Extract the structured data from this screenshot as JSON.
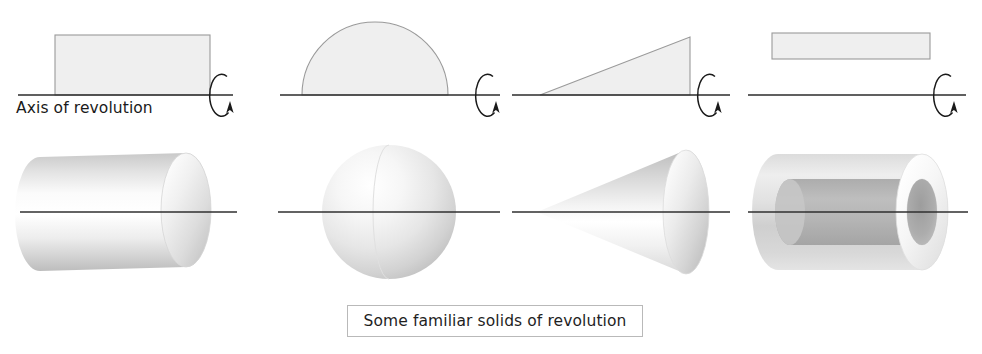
{
  "figure": {
    "width": 982,
    "height": 354,
    "background": "#ffffff",
    "axis_label": "Axis of revolution",
    "caption": "Some familiar solids of revolution",
    "caption_box": {
      "x": 347,
      "y": 305,
      "width": 296,
      "height": 32
    },
    "axis_label_pos": {
      "x": 16,
      "y": 99
    },
    "colors": {
      "axis_line": "#2b2b2b",
      "outline": "#8a8a8a",
      "fill_light": "#efefef",
      "solid_light": "#f4f4f4",
      "solid_mid": "#cfcfcf",
      "solid_dark": "#a8a8a8",
      "caption_border": "#b9b9b9"
    },
    "top_row": {
      "axis_y": 95,
      "panels": [
        {
          "name": "rectangle-generator",
          "shape": "rectangle",
          "axis": {
            "x1": 18,
            "x2": 233,
            "y": 95
          },
          "rect": {
            "x": 55,
            "y": 35,
            "width": 155,
            "height": 60
          },
          "spinner": {
            "cx": 224,
            "cy": 95,
            "rx": 12,
            "ry": 21
          }
        },
        {
          "name": "semicircle-generator",
          "shape": "semicircle",
          "axis": {
            "x1": 280,
            "x2": 500,
            "y": 95
          },
          "semicircle": {
            "cx": 375,
            "cy": 95,
            "r": 73
          },
          "spinner": {
            "cx": 490,
            "cy": 95,
            "rx": 12,
            "ry": 21
          }
        },
        {
          "name": "triangle-generator",
          "shape": "right-triangle",
          "axis": {
            "x1": 512,
            "x2": 730,
            "y": 95
          },
          "triangle": {
            "x_left": 540,
            "x_right": 690,
            "y_base": 95,
            "y_apex": 37
          },
          "spinner": {
            "cx": 712,
            "cy": 95,
            "rx": 12,
            "ry": 21
          }
        },
        {
          "name": "offset-rectangle-generator",
          "shape": "offset-rectangle",
          "axis": {
            "x1": 748,
            "x2": 966,
            "y": 95
          },
          "rect": {
            "x": 772,
            "y": 33,
            "width": 158,
            "height": 26
          },
          "spinner": {
            "cx": 948,
            "cy": 95,
            "rx": 12,
            "ry": 21
          }
        }
      ]
    },
    "bottom_row": {
      "axis_y": 212,
      "solids": [
        {
          "name": "cylinder",
          "label": "cylinder",
          "axis": {
            "x1": 20,
            "x2": 237,
            "y": 212
          },
          "body": {
            "x_left": 38,
            "x_right": 210,
            "cy": 212,
            "ry": 57,
            "cap_rx": 25
          }
        },
        {
          "name": "sphere",
          "label": "sphere",
          "axis": {
            "x1": 278,
            "x2": 500,
            "y": 212
          },
          "body": {
            "cx": 389,
            "cy": 212,
            "r": 67
          }
        },
        {
          "name": "cone",
          "label": "cone",
          "axis": {
            "x1": 512,
            "x2": 730,
            "y": 212
          },
          "body": {
            "apex_x": 537,
            "base_x": 692,
            "cy": 212,
            "ry": 62,
            "cap_rx": 23
          }
        },
        {
          "name": "tube",
          "label": "tube",
          "axis": {
            "x1": 748,
            "x2": 968,
            "y": 212
          },
          "body": {
            "x_left": 762,
            "x_right": 948,
            "cy": 212,
            "outer_ry": 58,
            "inner_ry": 33,
            "cap_rx": 26,
            "inner_cap_rx": 15
          }
        }
      ]
    }
  }
}
